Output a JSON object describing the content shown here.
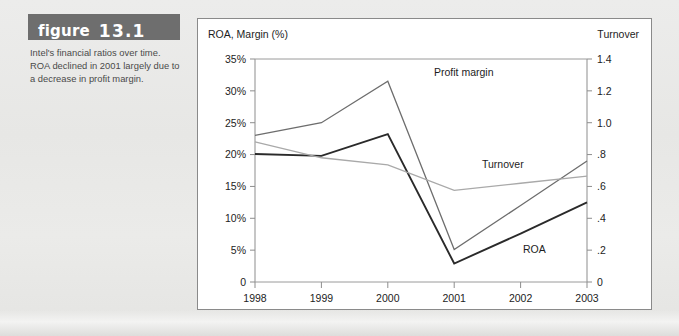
{
  "figure": {
    "label_word": "figure",
    "number": "13.1",
    "caption": "Intel's financial ratios over time. ROA declined in 2001 largely due to a decrease in profit margin.",
    "header_bg": "#6e6e6e",
    "header_text_color": "#ffffff",
    "caption_text_color": "#4a4a4a"
  },
  "page": {
    "background": "#e9e9e7"
  },
  "chart_panel": {
    "background": "#ffffff",
    "border_color": "#8a8a8a"
  },
  "chart_data": {
    "type": "line",
    "title": "",
    "xlabel": "",
    "ylabel": "ROA, Margin (%)",
    "y2label": "Turnover",
    "categories": [
      "1998",
      "1999",
      "2000",
      "2001",
      "2002",
      "2003"
    ],
    "x_tick_labels": [
      "1998",
      "1999",
      "2000",
      "2001",
      "2002",
      "2003"
    ],
    "y_tick_labels": [
      "0",
      "5%",
      "10%",
      "15%",
      "20%",
      "25%",
      "30%",
      "35%"
    ],
    "y_tick_values": [
      0,
      5,
      10,
      15,
      20,
      25,
      30,
      35
    ],
    "ylim": [
      0,
      35
    ],
    "y2_tick_labels": [
      "0",
      ".2",
      ".4",
      ".6",
      ".8",
      "1.0",
      "1.2",
      "1.4"
    ],
    "y2_tick_values": [
      0,
      0.2,
      0.4,
      0.6,
      0.8,
      1.0,
      1.2,
      1.4
    ],
    "y2lim": [
      0,
      1.4
    ],
    "grid": false,
    "legend": "inline-labels",
    "series": [
      {
        "name": "Profit margin",
        "axis": "left",
        "unit": "%",
        "color": "#6d6d6d",
        "stroke_width": 1.3,
        "values": [
          23.0,
          25.0,
          31.5,
          5.1,
          12.0,
          19.0
        ],
        "label_text": "Profit margin"
      },
      {
        "name": "ROA",
        "axis": "left",
        "unit": "%",
        "color": "#2a2a2a",
        "stroke_width": 1.9,
        "values": [
          20.1,
          19.8,
          23.2,
          2.9,
          7.6,
          12.5
        ],
        "label_text": "ROA"
      },
      {
        "name": "Turnover",
        "axis": "right",
        "unit": "x",
        "color": "#a9a9a9",
        "stroke_width": 1.3,
        "values": [
          0.88,
          0.78,
          0.735,
          0.575,
          0.62,
          0.665
        ],
        "label_text": "Turnover"
      }
    ],
    "annotations": [
      {
        "text": "Profit margin",
        "series": "Profit margin"
      },
      {
        "text": "Turnover",
        "series": "Turnover"
      },
      {
        "text": "ROA",
        "series": "ROA"
      }
    ]
  }
}
